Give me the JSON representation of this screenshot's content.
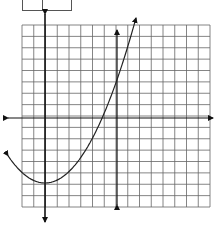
{
  "figure": {
    "top_fragment": {
      "visible": true,
      "note": "partially cropped table edge at top"
    }
  },
  "grid": {
    "left": 22,
    "right": 210,
    "top": 25,
    "bottom": 207,
    "cols": 16,
    "rows": 16,
    "line_color": "#666666"
  },
  "axes": {
    "x_axis_y": 118,
    "x_axis_from": 8,
    "x_axis_to": 213,
    "y_axis_x": 45,
    "y_axis_from": 14,
    "y_axis_to": 222,
    "color": "#111111"
  },
  "vertical_line": {
    "x": 117,
    "from": 30,
    "to": 205,
    "color": "#111111"
  },
  "parabola": {
    "vertex": [
      45,
      183
    ],
    "left_end": [
      8,
      155
    ],
    "right_end": [
      136,
      18
    ],
    "color": "#222222"
  },
  "chart_data": {
    "type": "line",
    "title": "",
    "xlabel": "",
    "ylabel": "",
    "grid": true,
    "series": [
      {
        "name": "parabola",
        "shape": "upward-opening parabola",
        "vertex_grid": [
          0,
          -6
        ],
        "direction": "opens up, arrows at both ends"
      },
      {
        "name": "vertical line",
        "x_grid": 6,
        "direction": "vertical with arrows at both ends"
      }
    ],
    "xlim": [
      -2,
      14
    ],
    "ylim": [
      -8,
      8
    ]
  }
}
